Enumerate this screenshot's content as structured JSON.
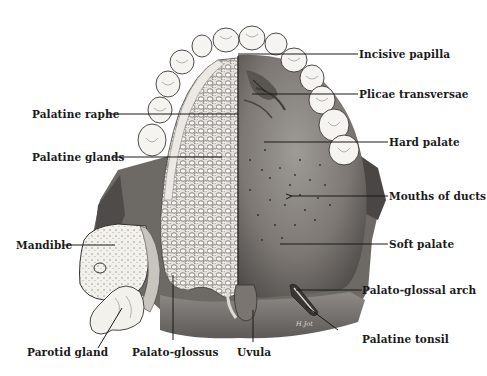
{
  "figure": {
    "signature": "H.Jot",
    "labels": {
      "incisive_papilla": "Incisive papilla",
      "plicae_transversae": "Plicae transversae",
      "palatine_raphe": "Palatine raphe",
      "hard_palate": "Hard palate",
      "palatine_glands": "Palatine glands",
      "mouths_of_ducts": "Mouths of ducts",
      "mandible": "Mandible",
      "soft_palate": "Soft palate",
      "palato_glossal_arch": "Palato-glossal arch",
      "palatine_tonsil": "Palatine tonsil",
      "parotid_gland": "Parotid gland",
      "palato_glossus": "Palato-glossus",
      "uvula": "Uvula"
    }
  }
}
